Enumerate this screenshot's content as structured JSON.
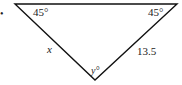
{
  "diagram": {
    "type": "triangle",
    "angles": {
      "top_left": "45°",
      "top_right": "45°",
      "bottom": "y°"
    },
    "sides": {
      "left": "x",
      "right": "13.5"
    },
    "bullet": "•"
  }
}
